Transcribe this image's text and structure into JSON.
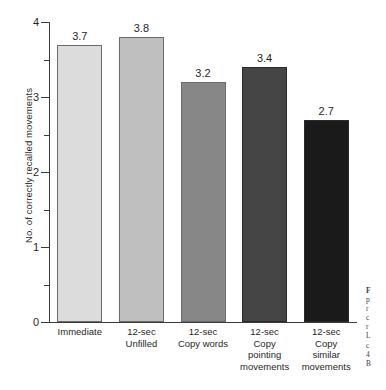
{
  "chart_data": {
    "type": "bar",
    "title": "",
    "xlabel": "",
    "ylabel": "No. of correctly recalled movements",
    "ylim": [
      0,
      4
    ],
    "grid": false,
    "legend": null,
    "categories": [
      "Immediate",
      "12-sec Unfilled",
      "12-sec Copy words",
      "12-sec Copy pointing movements",
      "12-sec Copy similar movements"
    ],
    "category_lines": [
      [
        "Immediate"
      ],
      [
        "12-sec",
        "Unfilled"
      ],
      [
        "12-sec",
        "Copy words"
      ],
      [
        "12-sec",
        "Copy",
        "pointing",
        "movements"
      ],
      [
        "12-sec",
        "Copy",
        "similar",
        "movements"
      ]
    ],
    "values": [
      3.7,
      3.8,
      3.2,
      3.4,
      2.7
    ],
    "value_labels": [
      "3.7",
      "3.8",
      "3.2",
      "3.4",
      "2.7"
    ],
    "bar_colors": [
      "#dcdcdc",
      "#bfbfbf",
      "#878787",
      "#454545",
      "#1a1a1a"
    ],
    "y_major_ticks": [
      "0",
      "1",
      "2",
      "3",
      "4"
    ],
    "y_major_values": [
      0,
      1,
      2,
      3,
      4
    ],
    "y_minor_values": [
      0.5,
      1.5,
      2.5,
      3.5
    ]
  },
  "caption": {
    "lines": [
      "F",
      "p",
      "r",
      "c",
      "r",
      "L",
      "c",
      "4",
      "B"
    ]
  }
}
